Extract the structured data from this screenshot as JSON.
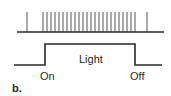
{
  "figure": {
    "panel_label": "b.",
    "stimulus_label": "Light",
    "on_label": "On",
    "off_label": "Off",
    "stroke_color": "#2a2a2a",
    "spike_color": "#555555"
  },
  "spike_train": {
    "baseline_y": 32,
    "baseline_x_start": 17,
    "baseline_x_end": 164,
    "spike_top_y": 12,
    "spike_x": [
      27,
      43,
      47,
      51,
      55,
      59,
      63,
      67,
      71,
      75,
      79,
      83,
      87,
      91,
      95,
      99,
      103,
      107,
      111,
      115,
      119,
      123,
      127,
      131,
      135,
      147
    ]
  },
  "stimulus_trace": {
    "low_y": 65,
    "high_y": 44,
    "x_start": 14,
    "on_x": 45,
    "off_x": 135,
    "x_end": 162
  }
}
